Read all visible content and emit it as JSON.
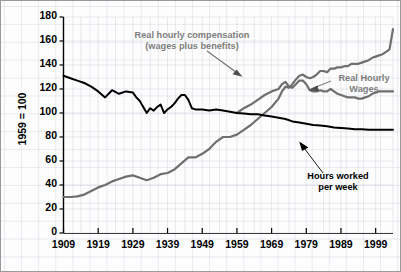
{
  "chart_data": {
    "type": "line",
    "title": "",
    "xlabel": "",
    "ylabel": "1959 = 100",
    "xlim": [
      1909,
      2004
    ],
    "ylim": [
      0,
      180
    ],
    "yticks": [
      0,
      20,
      40,
      60,
      80,
      100,
      120,
      140,
      160,
      180
    ],
    "xticks": [
      1909,
      1919,
      1929,
      1939,
      1949,
      1959,
      1969,
      1979,
      1989,
      1999
    ],
    "grid": true,
    "legend_position": "inline-annotations",
    "colors": {
      "compensation": "#6f6f6f",
      "wages": "#6f6f6f",
      "hours": "#000000",
      "grid": "#c3c8d8",
      "axis": "#000000",
      "annotation_gray": "#7d7d7d",
      "annotation_black": "#000000",
      "background": "#fdfdfd"
    },
    "annotations": [
      {
        "id": "compensation-label",
        "text_line1": "Real hourly compensation",
        "text_line2": "(wages plus benefits)",
        "color": "#7d7d7d"
      },
      {
        "id": "wages-label",
        "text_line1": "Real Hourly",
        "text_line2": "Wages",
        "color": "#7d7d7d"
      },
      {
        "id": "hours-label",
        "text_line1": "Hours worked",
        "text_line2": "per week",
        "color": "#000000"
      }
    ],
    "series": [
      {
        "name": "Real hourly compensation (wages plus benefits)",
        "color": "#6f6f6f",
        "x": [
          1909,
          1911,
          1913,
          1915,
          1917,
          1919,
          1921,
          1923,
          1925,
          1927,
          1929,
          1931,
          1933,
          1935,
          1937,
          1939,
          1941,
          1943,
          1945,
          1947,
          1949,
          1951,
          1953,
          1955,
          1957,
          1959,
          1961,
          1963,
          1965,
          1967,
          1969,
          1971,
          1972,
          1973,
          1974,
          1975,
          1976,
          1977,
          1978,
          1979,
          1980,
          1981,
          1982,
          1983,
          1984,
          1985,
          1986,
          1987,
          1988,
          1989,
          1990,
          1991,
          1992,
          1993,
          1994,
          1995,
          1996,
          1997,
          1998,
          1999,
          2000,
          2001,
          2002,
          2003,
          2004
        ],
        "values": [
          30,
          30,
          30.5,
          32,
          35,
          38,
          40,
          43,
          45,
          47,
          48,
          46,
          44,
          46,
          49,
          50,
          53,
          58,
          63,
          63,
          66,
          70,
          76,
          80,
          80,
          82,
          86,
          90,
          95,
          100,
          105,
          112,
          118,
          122,
          121,
          124,
          128,
          131,
          132,
          130,
          129,
          130,
          132,
          135,
          135,
          134,
          137,
          137,
          138,
          138,
          139,
          139,
          141,
          141,
          141,
          142,
          143,
          144,
          146,
          147,
          148,
          149,
          151,
          153,
          170
        ]
      },
      {
        "name": "Real Hourly Wages",
        "color": "#6f6f6f",
        "x": [
          1959,
          1961,
          1963,
          1965,
          1967,
          1969,
          1971,
          1972,
          1973,
          1974,
          1975,
          1976,
          1977,
          1978,
          1979,
          1980,
          1981,
          1982,
          1983,
          1984,
          1985,
          1986,
          1987,
          1988,
          1989,
          1990,
          1991,
          1992,
          1993,
          1994,
          1995,
          1996,
          1997,
          1998,
          1999,
          2000,
          2001,
          2002,
          2003,
          2004
        ],
        "values": [
          100,
          104,
          107,
          111,
          115,
          118,
          120,
          124,
          126,
          122,
          121,
          124,
          127,
          127,
          124,
          119,
          118,
          118,
          119,
          118,
          118,
          120,
          118,
          116,
          115,
          114,
          113,
          113,
          113,
          112,
          112,
          113,
          114,
          116,
          117,
          118,
          118,
          118,
          118,
          118
        ]
      },
      {
        "name": "Hours worked per week",
        "color": "#000000",
        "x": [
          1909,
          1911,
          1913,
          1915,
          1917,
          1919,
          1921,
          1923,
          1925,
          1927,
          1929,
          1930,
          1931,
          1932,
          1933,
          1934,
          1935,
          1936,
          1937,
          1938,
          1939,
          1940,
          1941,
          1942,
          1943,
          1944,
          1945,
          1946,
          1947,
          1949,
          1951,
          1953,
          1955,
          1957,
          1959,
          1961,
          1963,
          1965,
          1967,
          1969,
          1971,
          1973,
          1975,
          1977,
          1979,
          1981,
          1983,
          1985,
          1987,
          1989,
          1991,
          1993,
          1995,
          1997,
          1999,
          2001,
          2003,
          2004
        ],
        "values": [
          131,
          129,
          127,
          125,
          122,
          118,
          113,
          119,
          116,
          118,
          117,
          113,
          110,
          105,
          100,
          104,
          102,
          105,
          107,
          100,
          103,
          105,
          108,
          112,
          115,
          115,
          111,
          104,
          103,
          103,
          102,
          103,
          102,
          101,
          100,
          99.5,
          99,
          99,
          98,
          97,
          96,
          95,
          93,
          92,
          91,
          90,
          89.5,
          89,
          88,
          87.5,
          87,
          86.5,
          86.5,
          86,
          86,
          86,
          86,
          86
        ]
      }
    ]
  },
  "axis": {
    "ytick_labels": [
      "180",
      "160",
      "140",
      "120",
      "100",
      "80",
      "60",
      "40",
      "20",
      "0"
    ],
    "xtick_labels": [
      "1909",
      "1919",
      "1929",
      "1939",
      "1949",
      "1959",
      "1969",
      "1979",
      "1989",
      "1999"
    ],
    "ylabel": "1959 = 100"
  }
}
